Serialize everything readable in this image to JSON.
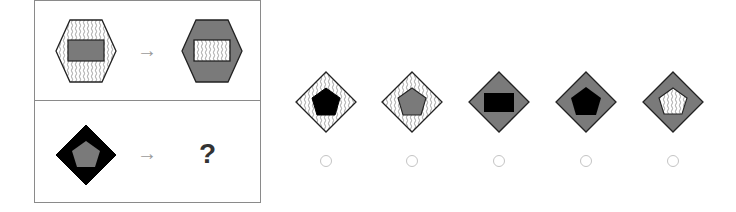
{
  "puzzle": {
    "colors": {
      "gray_fill": "#7a7a7a",
      "black_fill": "#000000",
      "white_fill": "#ffffff",
      "stroke": "#222222",
      "frame_border": "#8a8a8a",
      "arrow": "#9a9a9a",
      "radio_border": "#c4c4c4"
    },
    "example": {
      "source": {
        "outer": "hexagon",
        "outer_fill": "wavy-lines",
        "inner": "rectangle",
        "inner_fill": "gray"
      },
      "arrow": "→",
      "target": {
        "outer": "hexagon",
        "outer_fill": "gray",
        "inner": "rectangle",
        "inner_fill": "wavy-lines"
      }
    },
    "question": {
      "source": {
        "outer": "diamond",
        "outer_fill": "black",
        "inner": "pentagon",
        "inner_fill": "gray"
      },
      "arrow": "→",
      "placeholder": "?"
    },
    "options": [
      {
        "outer": "diamond",
        "outer_fill": "wavy-lines",
        "inner": "pentagon",
        "inner_fill": "black"
      },
      {
        "outer": "diamond",
        "outer_fill": "wavy-lines",
        "inner": "pentagon",
        "inner_fill": "gray"
      },
      {
        "outer": "diamond",
        "outer_fill": "gray",
        "inner": "rectangle",
        "inner_fill": "black"
      },
      {
        "outer": "diamond",
        "outer_fill": "gray",
        "inner": "pentagon",
        "inner_fill": "black"
      },
      {
        "outer": "diamond",
        "outer_fill": "gray",
        "inner": "pentagon",
        "inner_fill": "wavy-lines"
      }
    ]
  }
}
